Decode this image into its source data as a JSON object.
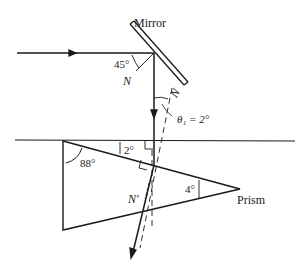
{
  "labels": {
    "mirror": "Mirror",
    "prism": "Prism",
    "angle_45": "45°",
    "normal_n1": "N",
    "normal_n2": "N",
    "theta1": "θ₁ = 2°",
    "angle_2": "2°",
    "angle_88": "88°",
    "normal_nprime": "N′",
    "angle_4": "4°"
  },
  "colors": {
    "line": "#1a1a1a",
    "background": "#ffffff"
  }
}
